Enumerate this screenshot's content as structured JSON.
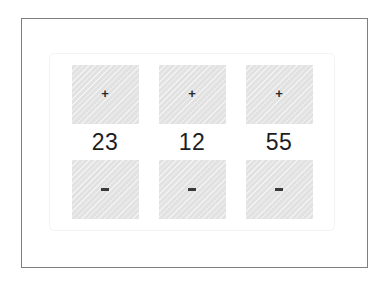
{
  "frame": {
    "border_color": "#7d7f82",
    "background": "#ffffff"
  },
  "panel": {
    "name": "counter-panel",
    "border_color": "#f2f3f4",
    "background": "#ffffff"
  },
  "theme": {
    "button_fill": "#e2e2e2",
    "glyph_color": "#2a2a2a",
    "value_color": "#1d1d1d"
  },
  "counters": [
    {
      "increment_label": "+",
      "increment_icon": "plus-icon",
      "value": "23",
      "decrement_label": "-",
      "decrement_icon": "minus-icon"
    },
    {
      "increment_label": "+",
      "increment_icon": "plus-icon",
      "value": "12",
      "decrement_label": "-",
      "decrement_icon": "minus-icon"
    },
    {
      "increment_label": "+",
      "increment_icon": "plus-icon",
      "value": "55",
      "decrement_label": "-",
      "decrement_icon": "minus-icon"
    }
  ]
}
